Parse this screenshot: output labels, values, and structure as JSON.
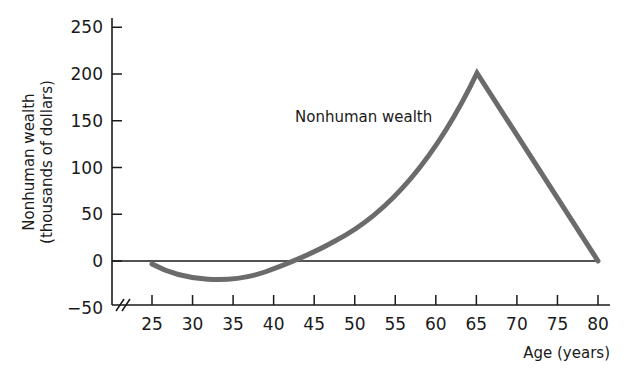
{
  "chart_data": {
    "type": "line",
    "title": "",
    "xlabel": "Age (years)",
    "ylabel_line1": "Nonhuman wealth",
    "ylabel_line2": "(thousands of dollars)",
    "x_ticks": [
      25,
      30,
      35,
      40,
      45,
      50,
      55,
      60,
      65,
      70,
      75,
      80
    ],
    "y_ticks": [
      -50,
      0,
      50,
      100,
      150,
      200,
      250
    ],
    "xlim": [
      25,
      80
    ],
    "ylim": [
      -50,
      250
    ],
    "grid": false,
    "axis_break": "x-axis break marks (//) near origin",
    "series": [
      {
        "name": "Nonhuman wealth",
        "x": [
          25,
          30,
          35,
          40,
          45,
          50,
          55,
          60,
          65,
          70,
          75,
          80
        ],
        "y": [
          -4,
          -15,
          -18,
          -13,
          0,
          20,
          50,
          100,
          200,
          135,
          68,
          0
        ]
      }
    ],
    "annotations": [
      {
        "text": "Nonhuman wealth",
        "x": 56,
        "y": 165
      }
    ],
    "colors": {
      "line": "#6b6b6b",
      "axis": "#1a1a1a",
      "background": "#ffffff"
    }
  }
}
